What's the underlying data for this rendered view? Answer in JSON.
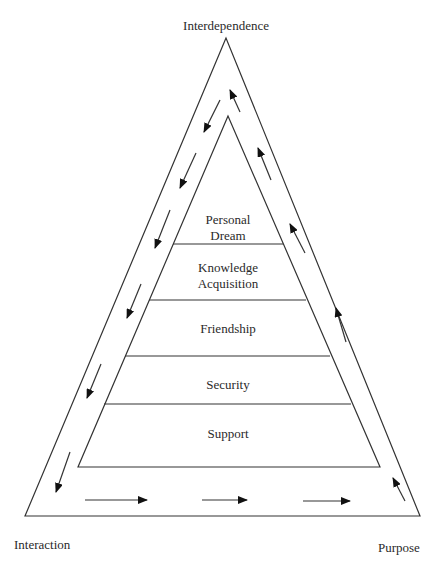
{
  "diagram": {
    "corners": {
      "top": "Interdependence",
      "bottom_left": "Interaction",
      "bottom_right": "Purpose"
    },
    "levels": [
      {
        "label_line1": "Personal",
        "label_line2": "Dream"
      },
      {
        "label_line1": "Knowledge",
        "label_line2": "Acquisition"
      },
      {
        "label_line1": "Friendship"
      },
      {
        "label_line1": "Security"
      },
      {
        "label_line1": "Support"
      }
    ],
    "flow": {
      "left_side_direction": "down",
      "bottom_direction": "right",
      "right_side_direction": "up"
    },
    "colors": {
      "line": "#333333",
      "text": "#2a2a2a",
      "background": "#ffffff"
    }
  }
}
